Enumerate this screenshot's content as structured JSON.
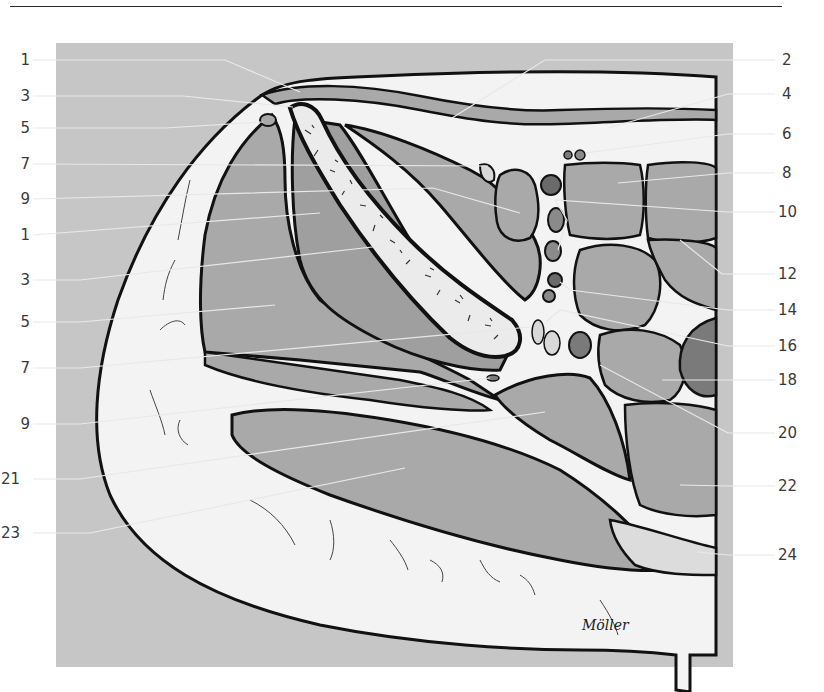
{
  "figure": {
    "type": "anatomical cross-section illustration",
    "signature": "Möller",
    "colors": {
      "panel_background": "#c6c6c6",
      "muscle": "#a9a9a9",
      "muscle_dark": "#9b9b9b",
      "vessel_artery": "#6a6a6a",
      "vessel_vein": "#8a8a8a",
      "fat": "#f3f3f3",
      "bone": "#ebebeb",
      "outline": "#111111",
      "leader_line": "#e8e8e8",
      "label_text": "#3a3a3a"
    }
  },
  "labels": {
    "left": [
      {
        "text": "1",
        "y": 60
      },
      {
        "text": "3",
        "y": 96
      },
      {
        "text": "5",
        "y": 128
      },
      {
        "text": "7",
        "y": 164
      },
      {
        "text": "9",
        "y": 199
      },
      {
        "text": "1",
        "y": 235
      },
      {
        "text": "3",
        "y": 280
      },
      {
        "text": "5",
        "y": 322
      },
      {
        "text": "7",
        "y": 368
      },
      {
        "text": "9",
        "y": 424
      },
      {
        "text": "21",
        "y": 479
      },
      {
        "text": "23",
        "y": 533
      }
    ],
    "right": [
      {
        "text": "2",
        "y": 60
      },
      {
        "text": "4",
        "y": 94
      },
      {
        "text": "6",
        "y": 134
      },
      {
        "text": "8",
        "y": 173
      },
      {
        "text": "10",
        "y": 212
      },
      {
        "text": "12",
        "y": 274
      },
      {
        "text": "14",
        "y": 310
      },
      {
        "text": "16",
        "y": 346
      },
      {
        "text": "18",
        "y": 380
      },
      {
        "text": "20",
        "y": 433
      },
      {
        "text": "22",
        "y": 486
      },
      {
        "text": "24",
        "y": 555
      }
    ]
  }
}
